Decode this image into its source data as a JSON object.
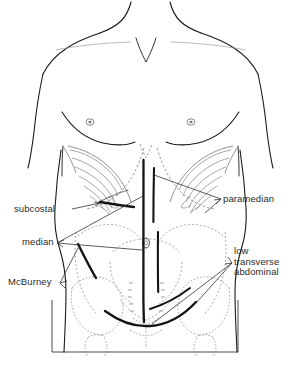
{
  "figure": {
    "view": "anterior",
    "frame_color": "#4a4a4a",
    "outline_color": "#1a1a1a",
    "incision_color": "#111111",
    "bone_color": "#8a8a8a",
    "leader_color": "#333333",
    "text_color": "#2b2b2b"
  },
  "labels": {
    "subcostal": "subcostal",
    "median": "median",
    "mcburney": "McBurney",
    "paramedian": "paramedian",
    "low_transverse": {
      "line1": "low",
      "line2": "transverse",
      "line3": "abdominal"
    }
  },
  "incisions": [
    {
      "name": "subcostal",
      "label": "subcostal"
    },
    {
      "name": "median",
      "label": "median"
    },
    {
      "name": "mcburney",
      "label": "McBurney"
    },
    {
      "name": "paramedian",
      "label": "paramedian"
    },
    {
      "name": "low-transverse-abdominal",
      "label": "low transverse abdominal"
    }
  ]
}
